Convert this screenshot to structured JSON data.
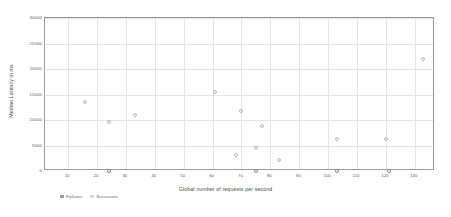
{
  "chart_data": {
    "type": "scatter",
    "title": "",
    "xlabel": "Global number of requests per second",
    "ylabel": "Median Latency in ms",
    "xlim": [
      2,
      137
    ],
    "ylim": [
      0,
      30000
    ],
    "grid": true,
    "legend_position": "bottom-left",
    "xticks": [
      10,
      20,
      30,
      40,
      50,
      60,
      70,
      80,
      90,
      100,
      110,
      120,
      130
    ],
    "yticks": [
      0,
      5000,
      10000,
      15000,
      20000,
      25000,
      30000
    ],
    "xticklabels": [
      "10",
      "20",
      "30",
      "40",
      "50",
      "60",
      "70",
      "80",
      "90",
      "100",
      "110",
      "120",
      "130"
    ],
    "yticklabels": [
      "0",
      "5000",
      "10000",
      "15000",
      "20000",
      "25000",
      "30000"
    ],
    "series": [
      {
        "name": "Failures",
        "marker": "circle-open",
        "color": "#8c8c8c",
        "points": [
          {
            "x": 24,
            "y": 0
          },
          {
            "x": 75,
            "y": 0
          },
          {
            "x": 103,
            "y": 0
          },
          {
            "x": 121,
            "y": 0
          }
        ]
      },
      {
        "name": "Successes",
        "marker": "circle-open",
        "color": "#b9b9b9",
        "points": [
          {
            "x": 16,
            "y": 13600
          },
          {
            "x": 24,
            "y": 9600
          },
          {
            "x": 33,
            "y": 11000
          },
          {
            "x": 61,
            "y": 15500
          },
          {
            "x": 68,
            "y": 3100
          },
          {
            "x": 70,
            "y": 11800
          },
          {
            "x": 75,
            "y": 4600
          },
          {
            "x": 77,
            "y": 8800
          },
          {
            "x": 83,
            "y": 2100
          },
          {
            "x": 103,
            "y": 6300
          },
          {
            "x": 120,
            "y": 6300
          },
          {
            "x": 133,
            "y": 22000
          }
        ]
      }
    ]
  },
  "legend": {
    "items": [
      {
        "label": "Failures",
        "key": "failures"
      },
      {
        "label": "Successes",
        "key": "successes"
      }
    ]
  }
}
